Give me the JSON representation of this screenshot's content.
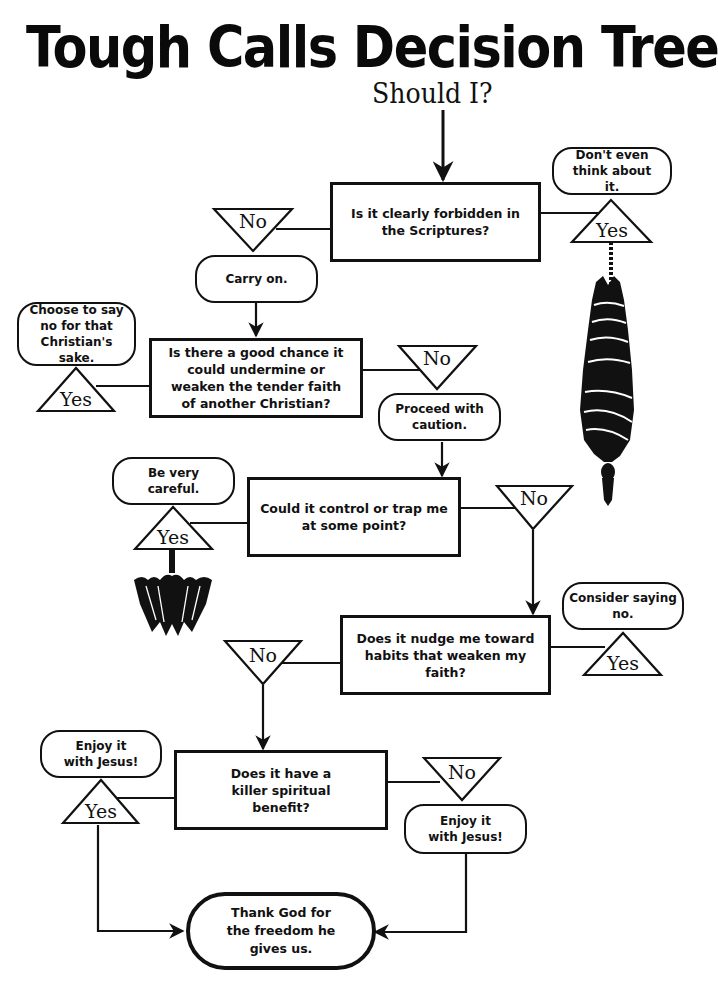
{
  "header": {
    "title": "Tough Calls Decision Tree",
    "subtitle": "Should I?"
  },
  "questions": [
    {
      "id": "q1",
      "text": "Is it clearly forbidden in the Scriptures?"
    },
    {
      "id": "q2",
      "text": "Is there a good chance it could undermine or weaken the tender faith of another Christian?"
    },
    {
      "id": "q3",
      "text": "Could it control or trap me at some point?"
    },
    {
      "id": "q4",
      "text": "Does it nudge me toward habits that weaken my faith?"
    },
    {
      "id": "q5",
      "text": "Does it have a killer spiritual benefit?"
    }
  ],
  "answers": {
    "q1_yes": "Don't even think about it.",
    "q1_no": "Carry on.",
    "q2_yes": "Choose to say no for that Christian's sake.",
    "q2_no": "Proceed with caution.",
    "q3_yes": "Be very careful.",
    "q4_yes": "Consider saying no.",
    "q5_yes": "Enjoy it with Jesus!",
    "q5_no": "Enjoy it with Jesus!",
    "final": "Thank God for the freedom he gives us."
  },
  "labels": {
    "yes": "Yes",
    "no": "No"
  },
  "illustrations": {
    "hanging_figure": "inverted bound figure hanging from rope",
    "bat": "hanging bat"
  }
}
